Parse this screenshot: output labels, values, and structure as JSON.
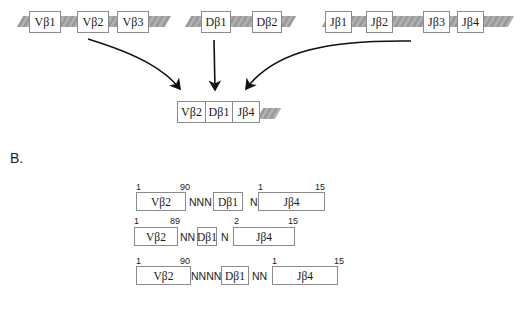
{
  "panel_a": {
    "v_cluster": [
      "Vβ1",
      "Vβ2",
      "Vβ3"
    ],
    "d_cluster": [
      "Dβ1",
      "Dβ2"
    ],
    "j_cluster": [
      "Jβ1",
      "Jβ2",
      "Jβ3",
      "Jβ4"
    ],
    "recombined": [
      "Vβ2",
      "Dβ1",
      "Jβ4"
    ]
  },
  "panel_b": {
    "label": "B.",
    "rows": [
      {
        "v": "Vβ2",
        "v_start": "1",
        "v_end": "90",
        "n1": "NNN",
        "d": "Dβ1",
        "n2": "N",
        "j": "Jβ4",
        "j_start": "1",
        "j_end": "15"
      },
      {
        "v": "Vβ2",
        "v_start": "1",
        "v_end": "89",
        "n1": "NN",
        "d": "Dβ1",
        "n2": "N",
        "j": "Jβ4",
        "j_start": "2",
        "j_end": "15"
      },
      {
        "v": "Vβ2",
        "v_start": "1",
        "v_end": "90",
        "n1": "NNNN",
        "d": "Dβ1",
        "n2": "NN",
        "j": "Jβ4",
        "j_start": "1",
        "j_end": "15"
      }
    ]
  }
}
